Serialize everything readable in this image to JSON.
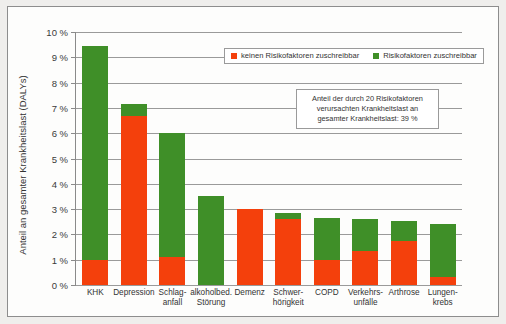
{
  "chart_data": {
    "type": "bar",
    "title": "",
    "subtitle": "",
    "xlabel": "",
    "ylabel": "Anteil an gesamter Krankheitslast (DALYs)",
    "ylim": [
      0,
      10
    ],
    "ytick_step": 1,
    "ytick_labels": [
      "10 %",
      "9 %",
      "8 %",
      "7 %",
      "6 %",
      "5 %",
      "4 %",
      "3 %",
      "2 %",
      "1 %",
      "0 %"
    ],
    "grid": true,
    "stacked": true,
    "legend_position": "top-center",
    "categories": [
      "KHK",
      "Depression",
      "Schlag-\nanfall",
      "alkoholbed.\nStörung",
      "Demenz",
      "Schwer-\nhörigkeit",
      "COPD",
      "Verkehrs-\nunfälle",
      "Arthrose",
      "Lungen-\nkrebs"
    ],
    "series": [
      {
        "name": "keinen Risikofaktoren zuschreibbar",
        "color": "#f4400c",
        "values": [
          1.0,
          6.7,
          1.1,
          0.0,
          3.0,
          2.6,
          1.0,
          1.35,
          1.75,
          0.3
        ]
      },
      {
        "name": "Risikofaktoren zuschreibbar",
        "color": "#3f8f28",
        "values": [
          8.45,
          0.45,
          4.9,
          3.5,
          0.0,
          0.25,
          1.65,
          1.25,
          0.8,
          2.1
        ]
      }
    ],
    "totals": [
      9.45,
      7.15,
      6.0,
      3.5,
      3.0,
      2.85,
      2.65,
      2.6,
      2.55,
      2.4
    ],
    "annotations": [
      {
        "name": "share-note",
        "text": "Anteil der durch 20 Risikofaktoren verursachten Krankheitslast an gesamter Krankheitslast: 39 %",
        "lines": [
          "Anteil der durch 20 Risikofaktoren",
          "verursachten Krankheitslast an",
          "gesamter Krankheitslast: 39 %"
        ],
        "value": "39 %"
      }
    ]
  },
  "legend": {
    "items": [
      {
        "label": "keinen Risikofaktoren zuschreibbar",
        "color": "#f4400c"
      },
      {
        "label": "Risikofaktoren zuschreibbar",
        "color": "#3f8f28"
      }
    ]
  },
  "colors": {
    "red": "#f4400c",
    "green": "#3f8f28",
    "grid": "#9a9a9a",
    "frame": "#8d8d8d",
    "background": "#fdfdfc"
  }
}
